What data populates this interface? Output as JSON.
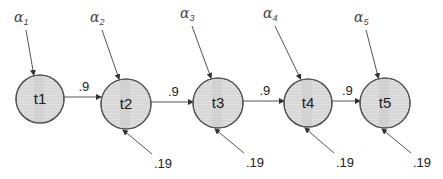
{
  "diagram": {
    "type": "chain",
    "nodes": [
      {
        "id": "t1",
        "label": "t1",
        "cx": 40,
        "cy": 99,
        "r": 24,
        "alpha": "α",
        "alpha_sub": "1",
        "ax": 14,
        "ay": 22,
        "self_in": null
      },
      {
        "id": "t2",
        "label": "t2",
        "cx": 126,
        "cy": 104,
        "r": 25,
        "alpha": "α",
        "alpha_sub": "2",
        "ax": 90,
        "ay": 22,
        "self_in": ".19"
      },
      {
        "id": "t3",
        "label": "t3",
        "cx": 218,
        "cy": 103,
        "r": 25,
        "alpha": "α",
        "alpha_sub": "3",
        "ax": 180,
        "ay": 18,
        "self_in": ".19"
      },
      {
        "id": "t4",
        "label": "t4",
        "cx": 308,
        "cy": 103,
        "r": 24,
        "alpha": "α",
        "alpha_sub": "4",
        "ax": 263,
        "ay": 18,
        "self_in": ".19"
      },
      {
        "id": "t5",
        "label": "t5",
        "cx": 385,
        "cy": 103,
        "r": 25,
        "alpha": "α",
        "alpha_sub": "5",
        "ax": 354,
        "ay": 22,
        "self_in": ".19"
      }
    ],
    "edges": [
      {
        "from": "t1",
        "to": "t2",
        "label": ".9"
      },
      {
        "from": "t2",
        "to": "t3",
        "label": ".9"
      },
      {
        "from": "t3",
        "to": "t4",
        "label": ".9"
      },
      {
        "from": "t4",
        "to": "t5",
        "label": ".9"
      }
    ],
    "colors": {
      "stroke": "#555555",
      "fill": "#dcdcdc",
      "fill_stripe": "#c8c8c8",
      "text": "#222222"
    }
  }
}
